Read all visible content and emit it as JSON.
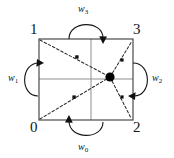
{
  "figure": {
    "type": "diagram",
    "colors": {
      "stroke": "#151515",
      "interior_grid": "#8f8f8f",
      "dashed": "#2b2b2b",
      "node_fill": "#000000",
      "background": "#ffffff"
    },
    "square": {
      "x": 39,
      "y": 39,
      "width": 94,
      "height": 81
    },
    "corner_labels": [
      {
        "id": "corner-1",
        "text": "1",
        "position": "top-left"
      },
      {
        "id": "corner-3",
        "text": "3",
        "position": "top-right"
      },
      {
        "id": "corner-0",
        "text": "0",
        "position": "bottom-left"
      },
      {
        "id": "corner-2",
        "text": "2",
        "position": "bottom-right"
      }
    ],
    "edge_labels": [
      {
        "id": "w3",
        "text": "w",
        "subscript": "3",
        "position": "top",
        "arrow": "clockwise-arc-into-top-edge"
      },
      {
        "id": "w2",
        "text": "w",
        "subscript": "2",
        "position": "right",
        "arrow": "clockwise-arc-into-right-edge"
      },
      {
        "id": "w0",
        "text": "w",
        "subscript": "0",
        "position": "bottom",
        "arrow": "clockwise-arc-into-bottom-edge"
      },
      {
        "id": "w1",
        "text": "w",
        "subscript": "1",
        "position": "left",
        "arrow": "clockwise-arc-into-left-edge"
      }
    ],
    "node": {
      "id": "center-node",
      "cx": 110,
      "cy": 77,
      "r": 4.6
    },
    "small_nodes": [
      {
        "id": "dot-upper-diagonal",
        "cx": 77,
        "cy": 57
      },
      {
        "id": "dot-lower-diagonal",
        "cx": 74,
        "cy": 97
      },
      {
        "id": "dot-upper-right",
        "cx": 122,
        "cy": 60
      },
      {
        "id": "dot-lower-right",
        "cx": 122,
        "cy": 97
      }
    ]
  }
}
